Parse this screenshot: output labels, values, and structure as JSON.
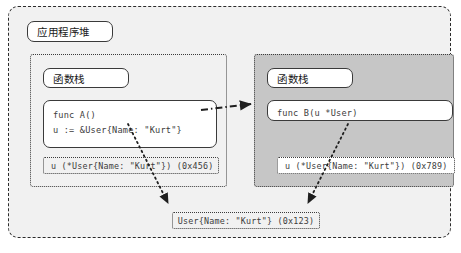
{
  "diagram": {
    "heap": {
      "title": "应用程序堆"
    },
    "left_stack": {
      "label": "函数栈",
      "code": {
        "line1": "func A()",
        "line2": "u := &User{Name: \"Kurt\"}"
      },
      "variable_cell": "u (*User{Name: \"Kurt\"}) (0x456)"
    },
    "right_stack": {
      "label": "函数栈",
      "code": {
        "line1": "func B(u *User)"
      },
      "variable_cell": "u (*User{Name: \"Kurt\"}) (0x789)"
    },
    "heap_object": "User{Name: \"Kurt\"} (0x123)",
    "colors": {
      "outer_background": "#f1f1f1",
      "right_stack_fill": "#c6c6c6",
      "border": "#2b2b2b",
      "code_text": "#3c3c3c",
      "page_background": "#ffffff"
    }
  }
}
